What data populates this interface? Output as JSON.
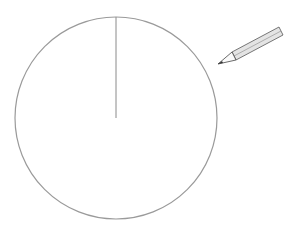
{
  "diagram": {
    "circle": {
      "cx": 116,
      "cy": 118,
      "r": 101,
      "stroke": "#9a9a9a"
    },
    "radius_line": {
      "x1": 116,
      "y1": 17,
      "x2": 116,
      "y2": 118,
      "stroke": "#8a8a8a"
    },
    "pencil": {
      "icon": "pencil-icon",
      "tip_x": 218,
      "tip_y": 63
    }
  }
}
